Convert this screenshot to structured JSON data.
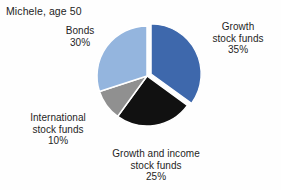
{
  "chart_data": {
    "type": "pie",
    "title": "Michele, age 50",
    "subtitle": "",
    "xlabel": "",
    "ylabel": "",
    "legend_position": "none",
    "grid": false,
    "labels_outside": true,
    "start_angle_deg": 0,
    "direction": "clockwise",
    "exploded_slices": [
      "Growth stock funds"
    ],
    "categories": [
      "Growth stock funds",
      "Growth and income stock funds",
      "International stock funds",
      "Bonds"
    ],
    "values": [
      35,
      25,
      10,
      30
    ],
    "value_unit": "%",
    "total": 100,
    "colors": [
      "#3E68AC",
      "#111111",
      "#909090",
      "#94B5DE"
    ],
    "slices": [
      {
        "name": "Growth stock funds",
        "label_lines": [
          "Growth",
          "stock funds"
        ],
        "value": 35,
        "value_text": "35%",
        "color": "#3E68AC",
        "exploded": true
      },
      {
        "name": "Growth and income stock funds",
        "label_lines": [
          "Growth and income",
          "stock funds"
        ],
        "value": 25,
        "value_text": "25%",
        "color": "#111111",
        "exploded": false
      },
      {
        "name": "International stock funds",
        "label_lines": [
          "International",
          "stock funds"
        ],
        "value": 10,
        "value_text": "10%",
        "color": "#909090",
        "exploded": false
      },
      {
        "name": "Bonds",
        "label_lines": [
          "Bonds"
        ],
        "value": 30,
        "value_text": "30%",
        "color": "#94B5DE",
        "exploded": false
      }
    ]
  },
  "figure": {
    "title": "Michele, age 50",
    "background_color": "#fefefe",
    "labels": {
      "bonds": {
        "line1": "Bonds",
        "pct": "30%"
      },
      "growth": {
        "line1": "Growth",
        "line2": "stock funds",
        "pct": "35%"
      },
      "international": {
        "line1": "International",
        "line2": "stock funds",
        "pct": "10%"
      },
      "growth_income": {
        "line1": "Growth and income",
        "line2": "stock funds",
        "pct": "25%"
      }
    }
  }
}
